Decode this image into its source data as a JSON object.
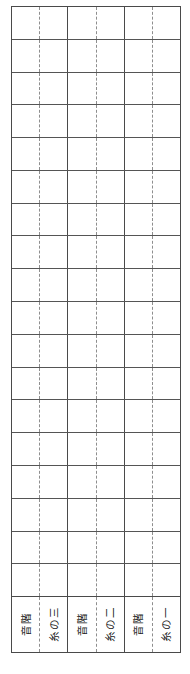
{
  "document": {
    "kind": "japanese-string-tablature-grid",
    "orientation": "vertical-text",
    "row_count": 18,
    "colors": {
      "page_background": "#ffffff",
      "solid_rule": "#4a4a4a",
      "row_rule": "#555555",
      "dashed_rule": "#8e8e8e",
      "text": "#1b1b1b"
    }
  },
  "grid": {
    "rows": [
      {
        "index": 1,
        "cells": [
          "",
          "",
          "",
          "",
          "",
          ""
        ]
      },
      {
        "index": 2,
        "cells": [
          "",
          "",
          "",
          "",
          "",
          ""
        ]
      },
      {
        "index": 3,
        "cells": [
          "",
          "",
          "",
          "",
          "",
          ""
        ]
      },
      {
        "index": 4,
        "cells": [
          "",
          "",
          "",
          "",
          "",
          ""
        ]
      },
      {
        "index": 5,
        "cells": [
          "",
          "",
          "",
          "",
          "",
          ""
        ]
      },
      {
        "index": 6,
        "cells": [
          "",
          "",
          "",
          "",
          "",
          ""
        ]
      },
      {
        "index": 7,
        "cells": [
          "",
          "",
          "",
          "",
          "",
          ""
        ]
      },
      {
        "index": 8,
        "cells": [
          "",
          "",
          "",
          "",
          "",
          ""
        ]
      },
      {
        "index": 9,
        "cells": [
          "",
          "",
          "",
          "",
          "",
          ""
        ]
      },
      {
        "index": 10,
        "cells": [
          "",
          "",
          "",
          "",
          "",
          ""
        ]
      },
      {
        "index": 11,
        "cells": [
          "",
          "",
          "",
          "",
          "",
          ""
        ]
      },
      {
        "index": 12,
        "cells": [
          "",
          "",
          "",
          "",
          "",
          ""
        ]
      },
      {
        "index": 13,
        "cells": [
          "",
          "",
          "",
          "",
          "",
          ""
        ]
      },
      {
        "index": 14,
        "cells": [
          "",
          "",
          "",
          "",
          "",
          ""
        ]
      },
      {
        "index": 15,
        "cells": [
          "",
          "",
          "",
          "",
          "",
          ""
        ]
      },
      {
        "index": 16,
        "cells": [
          "",
          "",
          "",
          "",
          "",
          ""
        ]
      },
      {
        "index": 17,
        "cells": [
          "",
          "",
          "",
          "",
          "",
          ""
        ]
      },
      {
        "index": 18,
        "cells": [
          "",
          "",
          "",
          "",
          "",
          ""
        ]
      }
    ]
  },
  "header": {
    "groups": [
      {
        "pitch_label": "音階",
        "string_label": "糸の三"
      },
      {
        "pitch_label": "音階",
        "string_label": "糸の二"
      },
      {
        "pitch_label": "音階",
        "string_label": "糸の一"
      }
    ]
  }
}
